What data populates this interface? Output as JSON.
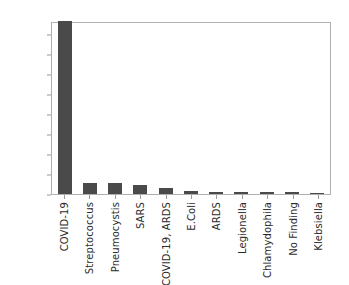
{
  "chart_data": {
    "type": "bar",
    "title": "",
    "xlabel": "",
    "ylabel": "",
    "ylim": [
      0,
      216
    ],
    "grid": false,
    "legend": false,
    "bar_color": "#4a4a4a",
    "axis_color": "#b0b0b0",
    "background": "#ffffff",
    "yticks": [
      0,
      25,
      50,
      75,
      100,
      125,
      150,
      175,
      200
    ],
    "categories": [
      "COVID-19",
      "Streptococcus",
      "Pneumocystis",
      "SARS",
      "COVID-19, ARDS",
      "E.Coli",
      "ARDS",
      "Legionella",
      "Chlamydophila",
      "No Finding",
      "Klebsiella"
    ],
    "values": [
      216,
      14,
      14,
      11,
      8,
      4,
      3,
      2,
      2,
      2,
      1
    ]
  }
}
